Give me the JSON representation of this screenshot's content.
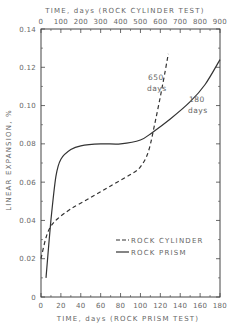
{
  "chart_data": {
    "type": "line",
    "title": "",
    "top_xlabel": "TIME, days (ROCK CYLINDER TEST)",
    "xlabel": "TIME, days (ROCK PRISM TEST)",
    "ylabel": "LINEAR EXPANSION, %",
    "xlim": [
      0,
      180
    ],
    "top_xlim": [
      0,
      900
    ],
    "ylim": [
      0,
      0.14
    ],
    "x_ticks": [
      "0",
      "20",
      "40",
      "60",
      "80",
      "100",
      "120",
      "140",
      "160",
      "180"
    ],
    "top_x_ticks": [
      "0",
      "100",
      "200",
      "300",
      "400",
      "500",
      "600",
      "700",
      "800",
      "900"
    ],
    "y_ticks": [
      "0",
      "0.02",
      "0.04",
      "0.06",
      "0.08",
      "0.10",
      "0.12",
      "0.14"
    ],
    "grid": false,
    "legend_position": "lower right",
    "series": [
      {
        "name": "ROCK CYLINDER",
        "style": "dashed",
        "axis": "top (days = x*5)",
        "x": [
          0,
          5,
          10,
          17,
          30,
          50,
          70,
          90,
          100,
          108,
          115,
          122,
          128
        ],
        "y": [
          0.02,
          0.031,
          0.037,
          0.041,
          0.046,
          0.052,
          0.058,
          0.064,
          0.068,
          0.076,
          0.092,
          0.11,
          0.127
        ]
      },
      {
        "name": "ROCK PRISM",
        "style": "solid",
        "axis": "bottom",
        "x": [
          5,
          10,
          15,
          20,
          30,
          40,
          60,
          80,
          100,
          112,
          130,
          150,
          165,
          180
        ],
        "y": [
          0.01,
          0.04,
          0.063,
          0.072,
          0.077,
          0.079,
          0.08,
          0.08,
          0.082,
          0.086,
          0.093,
          0.102,
          0.111,
          0.124
        ]
      }
    ],
    "annotations": [
      {
        "text_line1": "650",
        "text_line2": "days",
        "near_series": "ROCK CYLINDER"
      },
      {
        "text_line1": "180",
        "text_line2": "days",
        "near_series": "ROCK PRISM"
      }
    ]
  }
}
